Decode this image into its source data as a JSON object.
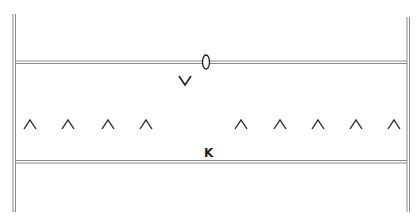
{
  "diagram": {
    "colors": {
      "line": "#8a8a8a",
      "ink": "#222222",
      "background": "#ffffff"
    },
    "walls": {
      "left": {
        "x": 14,
        "y1": 14,
        "y2": 212
      },
      "right": {
        "x": 408,
        "y1": 17,
        "y2": 212
      }
    },
    "rails": {
      "top": {
        "y": 62,
        "x1": 14,
        "x2": 408
      },
      "bottom": {
        "y": 162,
        "x1": 14,
        "x2": 408
      }
    },
    "marker_oval": {
      "cx": 206,
      "cy": 62,
      "rx": 3.5,
      "ry": 7
    },
    "labels": {
      "v": "V",
      "k": "K"
    },
    "carets": {
      "symbol": "^",
      "left_group_x": [
        30,
        68,
        108,
        146
      ],
      "right_group_x": [
        241,
        280,
        318,
        356,
        394
      ],
      "y": 124
    }
  }
}
